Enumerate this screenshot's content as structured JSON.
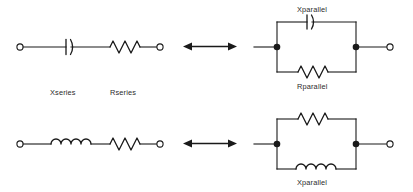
{
  "diagram": {
    "stroke_color": "#1a1a1a",
    "text_color": "#2b2b2b",
    "background_color": "#ffffff",
    "rows": [
      {
        "id": "rc-row",
        "left_circuit": {
          "id": "series-rc",
          "topology": "series",
          "components": [
            {
              "type": "capacitor",
              "label": "Xseries"
            },
            {
              "type": "resistor",
              "label": "Rseries"
            }
          ],
          "terminals": "open"
        },
        "arrow": {
          "name": "equivalence-arrow",
          "glyph": "double-headed"
        },
        "right_circuit": {
          "id": "parallel-rc",
          "topology": "parallel",
          "components": [
            {
              "type": "capacitor",
              "label": "Xparallel",
              "branch": "top"
            },
            {
              "type": "resistor",
              "label": "Rparallel",
              "branch": "bottom"
            }
          ],
          "terminals": "junction-dots-with-open-right"
        }
      },
      {
        "id": "rl-row",
        "left_circuit": {
          "id": "series-rl",
          "topology": "series",
          "components": [
            {
              "type": "inductor",
              "label": ""
            },
            {
              "type": "resistor",
              "label": ""
            }
          ],
          "terminals": "open"
        },
        "arrow": {
          "name": "equivalence-arrow",
          "glyph": "double-headed"
        },
        "right_circuit": {
          "id": "parallel-rl",
          "topology": "parallel",
          "components": [
            {
              "type": "resistor",
              "label": "",
              "branch": "top"
            },
            {
              "type": "inductor",
              "label": "Xparallel",
              "branch": "bottom"
            }
          ],
          "terminals": "junction-dots-with-open-right"
        }
      }
    ],
    "labels": {
      "xseries": "Xseries",
      "rseries": "Rseries",
      "xparallel_rc": "Xparallel",
      "rparallel_rc": "Rparallel",
      "xparallel_rl": "Xparallel"
    }
  }
}
